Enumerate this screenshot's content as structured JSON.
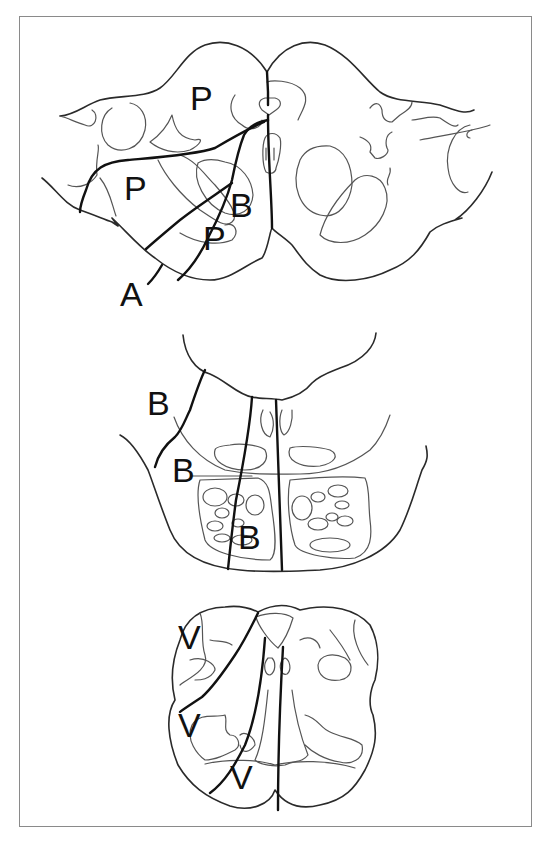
{
  "figure": {
    "type": "anatomical line drawing",
    "panels": [
      {
        "name": "upper-section",
        "labels": [
          {
            "text": "P",
            "x": 190,
            "y": 83
          },
          {
            "text": "P",
            "x": 124,
            "y": 173
          },
          {
            "text": "B",
            "x": 230,
            "y": 190
          },
          {
            "text": "P",
            "x": 203,
            "y": 223
          },
          {
            "text": "A",
            "x": 120,
            "y": 279
          }
        ]
      },
      {
        "name": "middle-section",
        "labels": [
          {
            "text": "B",
            "x": 147,
            "y": 388
          },
          {
            "text": "B",
            "x": 172,
            "y": 455
          },
          {
            "text": "B",
            "x": 238,
            "y": 522
          }
        ]
      },
      {
        "name": "lower-section",
        "labels": [
          {
            "text": "V",
            "x": 178,
            "y": 622
          },
          {
            "text": "V",
            "x": 178,
            "y": 710
          },
          {
            "text": "V",
            "x": 230,
            "y": 762
          }
        ]
      }
    ],
    "colors": {
      "line": "#111111",
      "thin_line": "#555555",
      "frame": "#8a8a8a",
      "background": "#ffffff"
    }
  }
}
